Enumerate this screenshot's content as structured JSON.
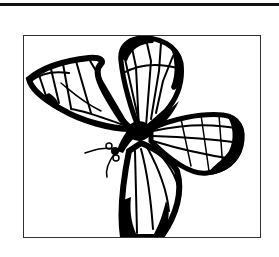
{
  "image": {
    "subject": "butterfly line art",
    "style": "black and white illustration",
    "colors": {
      "ink": "#000000",
      "paper": "#ffffff",
      "frame": "#333333"
    }
  }
}
